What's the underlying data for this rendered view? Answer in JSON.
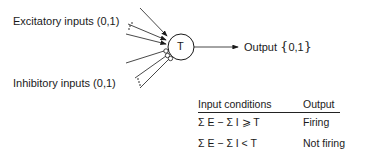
{
  "diagram": {
    "neuron_symbol": "T",
    "excitatory_label": "Excitatory inputs (0,1)",
    "inhibitory_label": "Inhibitory inputs (0,1)",
    "output_label": "Output",
    "output_values": "0,1",
    "brace_open": "{",
    "brace_close": "}"
  },
  "table": {
    "headers": [
      "Input conditions",
      "Output"
    ],
    "rows": [
      {
        "condition": "Σ E  −  Σ I  ⩾  T",
        "output": "Firing"
      },
      {
        "condition": "Σ E  −  Σ I  <  T",
        "output": "Not firing"
      }
    ]
  }
}
